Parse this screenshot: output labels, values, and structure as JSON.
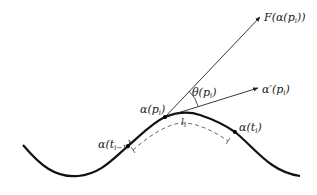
{
  "diagram": {
    "type": "curve-with-vectors",
    "labels": {
      "force_vector": "F(α(p",
      "force_vector_sub": "i",
      "force_vector_close": "))",
      "tangent_vector": "α′(p",
      "tangent_vector_sub": "i",
      "tangent_vector_close": ")",
      "angle": "θ(p",
      "angle_sub": "i",
      "angle_close": ")",
      "point_p": "α(p",
      "point_p_sub": "i",
      "point_p_close": ")",
      "point_prev": "α(t",
      "point_prev_sub": "i−1",
      "point_prev_close": ")",
      "point_next": "α(t",
      "point_next_sub": "i",
      "point_next_close": ")",
      "arc_length": "l",
      "arc_length_sub": "i"
    },
    "colors": {
      "curve": "#111111",
      "vectors": "#222222",
      "dashed": "#444444",
      "background": "#ffffff"
    }
  }
}
